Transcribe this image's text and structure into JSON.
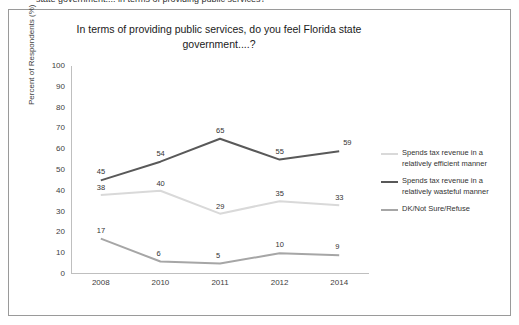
{
  "page": {
    "cut_off_header": "state government.... in terms of providing public services?"
  },
  "chart_data": {
    "type": "line",
    "title": "In terms of providing public services, do you feel Florida state government....?",
    "xlabel": "",
    "ylabel": "Percent of Respondents (%)",
    "categories": [
      "2008",
      "2010",
      "2011",
      "2012",
      "2014"
    ],
    "ylim": [
      0,
      100
    ],
    "yticks": [
      0,
      10,
      20,
      30,
      40,
      50,
      60,
      70,
      80,
      90,
      100
    ],
    "grid": false,
    "legend_position": "right",
    "series": [
      {
        "name": "Spends tax revenue in a relatively efficient manner",
        "color": "#d9d9d9",
        "values": [
          38,
          40,
          29,
          35,
          33
        ],
        "labels": [
          "38",
          "40",
          "29",
          "35",
          "33"
        ]
      },
      {
        "name": "Spends tax revenue in a relatively wasteful manner",
        "color": "#595959",
        "values": [
          45,
          54,
          65,
          55,
          59
        ],
        "labels": [
          "45",
          "54",
          "65",
          "55",
          "59"
        ]
      },
      {
        "name": "DK/Not Sure/Refuse",
        "color": "#a6a6a6",
        "values": [
          17,
          6,
          5,
          10,
          9
        ],
        "labels": [
          "17",
          "6",
          "5",
          "10",
          "9"
        ]
      }
    ]
  }
}
